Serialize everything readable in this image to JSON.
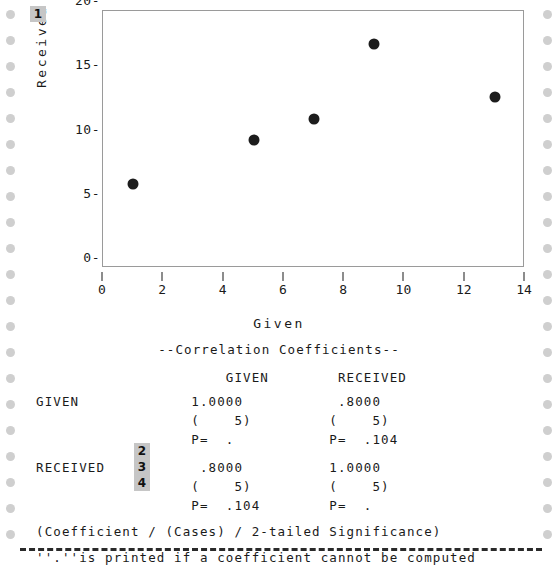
{
  "chart_data": {
    "type": "scatter",
    "title": "",
    "xlabel": "Given",
    "ylabel": "Received",
    "xlim": [
      0,
      14
    ],
    "ylim": [
      0,
      20
    ],
    "xticks": [
      0,
      2,
      4,
      6,
      8,
      10,
      12,
      14
    ],
    "yticks": [
      0,
      5,
      10,
      15,
      20
    ],
    "grid": false,
    "legend": null,
    "series": [
      {
        "name": "Received vs Given",
        "x": [
          1,
          5,
          7,
          9,
          13
        ],
        "y": [
          6.5,
          10.0,
          11.6,
          17.4,
          13.3
        ]
      }
    ]
  },
  "chart": {
    "ytick_labels": [
      "20-",
      "15-",
      "10-",
      "5-",
      "0-"
    ],
    "xtick_labels": [
      "0",
      "2",
      "4",
      "6",
      "8",
      "10",
      "12",
      "14"
    ],
    "xaxis_title": "Given",
    "yaxis_title": "Received"
  },
  "annotations": {
    "badge_1": "1",
    "badge_2": "2",
    "badge_3": "3",
    "badge_4": "4"
  },
  "report": {
    "heading": "--Correlation Coefficients--",
    "column_headers": "                      GIVEN        RECEIVED",
    "row_given_value": "GIVEN             1.0000           .8000",
    "row_given_cases": "                  (    5)         (    5)",
    "row_given_p": "                  P=  .           P=  .104",
    "row_received_value": "RECEIVED           .8000          1.0000",
    "row_received_cases": "                  (    5)         (    5)",
    "row_received_p": "                  P=  .104        P=  .",
    "footnote_1": "(Coefficient / (Cases) / 2-tailed Significance)",
    "footnote_2": "''.''is printed if a coefficient cannot be computed"
  },
  "colors": {
    "paper": "#ffffff",
    "ink": "#1a1a1a",
    "badge_bg": "#c6c6c6",
    "feed_hole": "#cfcfcf",
    "plot_border": "#9a9a9a",
    "dot": "#1c1c1c"
  }
}
